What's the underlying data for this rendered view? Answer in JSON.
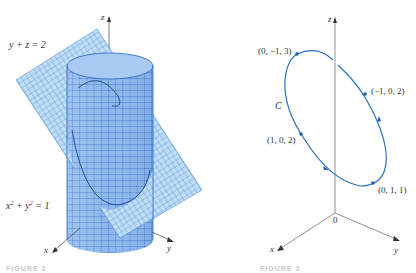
{
  "figure_left": {
    "plane_label": "y + z = 2",
    "cylinder_label_x": "x",
    "cylinder_label_rest": " + y",
    "cylinder_label_eq": " = 1",
    "sup": "2",
    "axes": {
      "x": "x",
      "y": "y",
      "z": "z"
    },
    "caption": "FIGURE 2",
    "colors": {
      "cylinder_fill": "#8db8ec",
      "cylinder_grid": "#2a63c9",
      "plane_fill": "#c2def7",
      "plane_grid": "#4b8fd8",
      "axis": "#555555"
    }
  },
  "figure_right": {
    "curve_label": "C",
    "points": [
      {
        "label": "(0, −1, 3)"
      },
      {
        "label": "(−1, 0, 2)"
      },
      {
        "label": "(1, 0, 2)"
      },
      {
        "label": "(0, 1, 1)"
      }
    ],
    "origin_label": "0",
    "axes": {
      "x": "x",
      "y": "y",
      "z": "z"
    },
    "caption": "FIGURE 3",
    "colors": {
      "curve": "#2a6fc4",
      "axis": "#777777"
    }
  }
}
